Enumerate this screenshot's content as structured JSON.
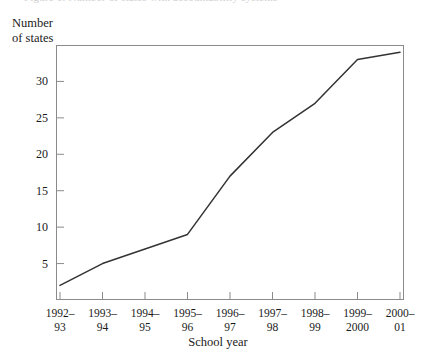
{
  "figure": {
    "caption_sliver": "Figure 1. Number of states with accountability systems",
    "x_axis_title": "School year",
    "y_axis_title": "Number\nof states",
    "line_color": "#333333",
    "frame_color": "#8b8b8b"
  },
  "chart_data": {
    "type": "line",
    "title": "",
    "xlabel": "School year",
    "ylabel": "Number of states",
    "categories": [
      "1992–\n93",
      "1993–\n94",
      "1994–\n95",
      "1995–\n96",
      "1996–\n97",
      "1997–\n98",
      "1998–\n99",
      "1999–\n2000",
      "2000–\n01"
    ],
    "categories_flat": [
      "1992–93",
      "1993–94",
      "1994–95",
      "1995–96",
      "1996–97",
      "1997–98",
      "1998–99",
      "1999–2000",
      "2000–01"
    ],
    "values": [
      2,
      5,
      7,
      9,
      17,
      23,
      27,
      33,
      34
    ],
    "ylim": [
      0,
      35
    ],
    "yticks": [
      5,
      10,
      15,
      20,
      25,
      30
    ],
    "ytick_labels": [
      "5",
      "10",
      "15",
      "20",
      "25",
      "30"
    ],
    "grid": false,
    "legend": false,
    "markers": false
  }
}
